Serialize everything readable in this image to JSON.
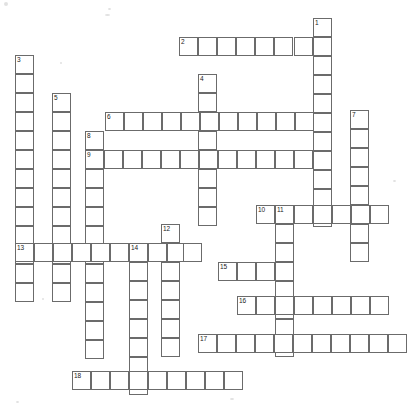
{
  "puzzle": {
    "title": "Crossword Puzzle Grid",
    "type": "crossword-grid",
    "width": 420,
    "height": 410,
    "cell_size": 19.2,
    "origin_x": 15,
    "origin_y": 18,
    "line_color": "#6b6b6b",
    "cell_fill": "#ffffff",
    "background": "#ffffff",
    "number_color": "#1a1a1a",
    "entries": [
      {
        "number": "1",
        "direction": "down",
        "col": 15,
        "row": 0,
        "length": 10
      },
      {
        "number": "2",
        "direction": "across",
        "col": 9,
        "row": 1,
        "length": 7
      },
      {
        "number": "3",
        "direction": "down",
        "col": 0,
        "row": 2,
        "length": 12
      },
      {
        "number": "4",
        "direction": "down",
        "col": 10,
        "row": 3,
        "length": 8
      },
      {
        "number": "5",
        "direction": "down",
        "col": 2,
        "row": 4,
        "length": 11
      },
      {
        "number": "6",
        "direction": "across",
        "col": 5,
        "row": 5,
        "length": 11
      },
      {
        "number": "7",
        "direction": "down",
        "col": 17,
        "row": 5,
        "length": 8
      },
      {
        "number": "8",
        "direction": "down",
        "col": 4,
        "row": 6,
        "length": 7
      },
      {
        "number": "9",
        "direction": "across",
        "col": 4,
        "row": 7,
        "length": 12
      },
      {
        "number": "10",
        "direction": "across",
        "col": 12,
        "row": 10,
        "length": 7
      },
      {
        "number": "11",
        "direction": "down",
        "col": 13,
        "row": 10,
        "length": 8
      },
      {
        "number": "12",
        "direction": "down",
        "col": 8,
        "row": 11,
        "length": 9
      },
      {
        "number": "13",
        "direction": "across",
        "col": 0,
        "row": 12,
        "length": 10
      },
      {
        "number": "14",
        "direction": "down",
        "col": 6,
        "row": 12,
        "length": 9
      },
      {
        "number": "15",
        "direction": "across",
        "col": 11,
        "row": 13,
        "length": 3
      },
      {
        "number": "16",
        "direction": "across",
        "col": 12,
        "row": 15,
        "length": 8
      },
      {
        "number": "17",
        "direction": "across",
        "col": 10,
        "row": 17,
        "length": 11
      },
      {
        "number": "18",
        "direction": "across",
        "col": 3,
        "row": 19,
        "length": 9
      }
    ],
    "cells": [
      {
        "x": 313,
        "y": 18,
        "n": "1"
      },
      {
        "x": 313,
        "y": 37
      },
      {
        "x": 313,
        "y": 56
      },
      {
        "x": 313,
        "y": 75
      },
      {
        "x": 313,
        "y": 94
      },
      {
        "x": 313,
        "y": 113
      },
      {
        "x": 313,
        "y": 132
      },
      {
        "x": 313,
        "y": 151
      },
      {
        "x": 313,
        "y": 170
      },
      {
        "x": 313,
        "y": 189
      },
      {
        "x": 313,
        "y": 208
      },
      {
        "x": 179,
        "y": 37,
        "n": "2"
      },
      {
        "x": 198,
        "y": 37
      },
      {
        "x": 217,
        "y": 37
      },
      {
        "x": 236,
        "y": 37
      },
      {
        "x": 255,
        "y": 37
      },
      {
        "x": 274,
        "y": 37
      },
      {
        "x": 294,
        "y": 37
      },
      {
        "x": 15,
        "y": 55,
        "n": "3"
      },
      {
        "x": 15,
        "y": 74
      },
      {
        "x": 15,
        "y": 93
      },
      {
        "x": 15,
        "y": 112
      },
      {
        "x": 15,
        "y": 131
      },
      {
        "x": 15,
        "y": 150
      },
      {
        "x": 15,
        "y": 169
      },
      {
        "x": 15,
        "y": 188
      },
      {
        "x": 15,
        "y": 207
      },
      {
        "x": 15,
        "y": 226
      },
      {
        "x": 15,
        "y": 245
      },
      {
        "x": 15,
        "y": 264
      },
      {
        "x": 15,
        "y": 283
      },
      {
        "x": 198,
        "y": 74,
        "n": "4"
      },
      {
        "x": 198,
        "y": 93
      },
      {
        "x": 198,
        "y": 112
      },
      {
        "x": 198,
        "y": 131
      },
      {
        "x": 198,
        "y": 150
      },
      {
        "x": 198,
        "y": 169
      },
      {
        "x": 198,
        "y": 188
      },
      {
        "x": 198,
        "y": 207
      },
      {
        "x": 52,
        "y": 93,
        "n": "5"
      },
      {
        "x": 52,
        "y": 112
      },
      {
        "x": 52,
        "y": 131
      },
      {
        "x": 52,
        "y": 150
      },
      {
        "x": 52,
        "y": 169
      },
      {
        "x": 52,
        "y": 188
      },
      {
        "x": 52,
        "y": 207
      },
      {
        "x": 52,
        "y": 226
      },
      {
        "x": 52,
        "y": 245
      },
      {
        "x": 52,
        "y": 264
      },
      {
        "x": 52,
        "y": 283
      },
      {
        "x": 105,
        "y": 112,
        "n": "6"
      },
      {
        "x": 124,
        "y": 112
      },
      {
        "x": 143,
        "y": 112
      },
      {
        "x": 162,
        "y": 112
      },
      {
        "x": 181,
        "y": 112
      },
      {
        "x": 200,
        "y": 112
      },
      {
        "x": 219,
        "y": 112
      },
      {
        "x": 238,
        "y": 112
      },
      {
        "x": 257,
        "y": 112
      },
      {
        "x": 276,
        "y": 112
      },
      {
        "x": 295,
        "y": 112
      },
      {
        "x": 350,
        "y": 110,
        "n": "7"
      },
      {
        "x": 350,
        "y": 129
      },
      {
        "x": 350,
        "y": 148
      },
      {
        "x": 350,
        "y": 167
      },
      {
        "x": 350,
        "y": 186
      },
      {
        "x": 350,
        "y": 205
      },
      {
        "x": 350,
        "y": 224
      },
      {
        "x": 350,
        "y": 243
      },
      {
        "x": 85,
        "y": 131,
        "n": "8"
      },
      {
        "x": 85,
        "y": 150
      },
      {
        "x": 85,
        "y": 169
      },
      {
        "x": 85,
        "y": 188
      },
      {
        "x": 85,
        "y": 207
      },
      {
        "x": 85,
        "y": 226
      },
      {
        "x": 85,
        "y": 245
      },
      {
        "x": 85,
        "y": 264
      },
      {
        "x": 85,
        "y": 283
      },
      {
        "x": 85,
        "y": 302
      },
      {
        "x": 85,
        "y": 321
      },
      {
        "x": 85,
        "y": 340
      },
      {
        "x": 85,
        "y": 150,
        "n": "9"
      },
      {
        "x": 104,
        "y": 150
      },
      {
        "x": 123,
        "y": 150
      },
      {
        "x": 142,
        "y": 150
      },
      {
        "x": 161,
        "y": 150
      },
      {
        "x": 180,
        "y": 150
      },
      {
        "x": 199,
        "y": 150
      },
      {
        "x": 218,
        "y": 150
      },
      {
        "x": 237,
        "y": 150
      },
      {
        "x": 256,
        "y": 150
      },
      {
        "x": 275,
        "y": 150
      },
      {
        "x": 294,
        "y": 150
      },
      {
        "x": 256,
        "y": 205,
        "n": "10"
      },
      {
        "x": 275,
        "y": 205,
        "n": "11"
      },
      {
        "x": 294,
        "y": 205
      },
      {
        "x": 313,
        "y": 205
      },
      {
        "x": 332,
        "y": 205
      },
      {
        "x": 351,
        "y": 205
      },
      {
        "x": 370,
        "y": 205
      },
      {
        "x": 275,
        "y": 224
      },
      {
        "x": 275,
        "y": 243
      },
      {
        "x": 275,
        "y": 262
      },
      {
        "x": 275,
        "y": 281
      },
      {
        "x": 275,
        "y": 300
      },
      {
        "x": 275,
        "y": 319
      },
      {
        "x": 275,
        "y": 338
      },
      {
        "x": 161,
        "y": 224,
        "n": "12"
      },
      {
        "x": 161,
        "y": 243
      },
      {
        "x": 161,
        "y": 262
      },
      {
        "x": 161,
        "y": 281
      },
      {
        "x": 161,
        "y": 300
      },
      {
        "x": 161,
        "y": 319
      },
      {
        "x": 161,
        "y": 338
      },
      {
        "x": 15,
        "y": 243,
        "n": "13"
      },
      {
        "x": 34,
        "y": 243
      },
      {
        "x": 53,
        "y": 243
      },
      {
        "x": 72,
        "y": 243
      },
      {
        "x": 91,
        "y": 243
      },
      {
        "x": 110,
        "y": 243
      },
      {
        "x": 129,
        "y": 243
      },
      {
        "x": 148,
        "y": 243
      },
      {
        "x": 167,
        "y": 243
      },
      {
        "x": 183,
        "y": 243
      },
      {
        "x": 129,
        "y": 243,
        "n": "14"
      },
      {
        "x": 129,
        "y": 262
      },
      {
        "x": 129,
        "y": 281
      },
      {
        "x": 129,
        "y": 300
      },
      {
        "x": 129,
        "y": 319
      },
      {
        "x": 129,
        "y": 338
      },
      {
        "x": 129,
        "y": 357
      },
      {
        "x": 129,
        "y": 376
      },
      {
        "x": 218,
        "y": 262,
        "n": "15"
      },
      {
        "x": 237,
        "y": 262
      },
      {
        "x": 256,
        "y": 262
      },
      {
        "x": 237,
        "y": 296,
        "n": "16"
      },
      {
        "x": 256,
        "y": 296
      },
      {
        "x": 275,
        "y": 296
      },
      {
        "x": 294,
        "y": 296
      },
      {
        "x": 313,
        "y": 296
      },
      {
        "x": 332,
        "y": 296
      },
      {
        "x": 351,
        "y": 296
      },
      {
        "x": 370,
        "y": 296
      },
      {
        "x": 198,
        "y": 334,
        "n": "17"
      },
      {
        "x": 217,
        "y": 334
      },
      {
        "x": 236,
        "y": 334
      },
      {
        "x": 255,
        "y": 334
      },
      {
        "x": 274,
        "y": 334
      },
      {
        "x": 293,
        "y": 334
      },
      {
        "x": 312,
        "y": 334
      },
      {
        "x": 331,
        "y": 334
      },
      {
        "x": 350,
        "y": 334
      },
      {
        "x": 369,
        "y": 334
      },
      {
        "x": 388,
        "y": 334
      },
      {
        "x": 72,
        "y": 371,
        "n": "18"
      },
      {
        "x": 91,
        "y": 371
      },
      {
        "x": 110,
        "y": 371
      },
      {
        "x": 129,
        "y": 371
      },
      {
        "x": 148,
        "y": 371
      },
      {
        "x": 167,
        "y": 371
      },
      {
        "x": 186,
        "y": 371
      },
      {
        "x": 205,
        "y": 371
      },
      {
        "x": 224,
        "y": 371
      }
    ],
    "specks": [
      {
        "x": 4,
        "y": 2,
        "w": 4,
        "h": 4
      },
      {
        "x": 108,
        "y": 8,
        "w": 3,
        "h": 2
      },
      {
        "x": 105,
        "y": 14,
        "w": 5,
        "h": 2
      },
      {
        "x": 60,
        "y": 62,
        "w": 2,
        "h": 2
      },
      {
        "x": 393,
        "y": 180,
        "w": 3,
        "h": 2
      },
      {
        "x": 42,
        "y": 298,
        "w": 2,
        "h": 2
      },
      {
        "x": 16,
        "y": 401,
        "w": 3,
        "h": 2
      },
      {
        "x": 230,
        "y": 398,
        "w": 4,
        "h": 2
      }
    ]
  }
}
